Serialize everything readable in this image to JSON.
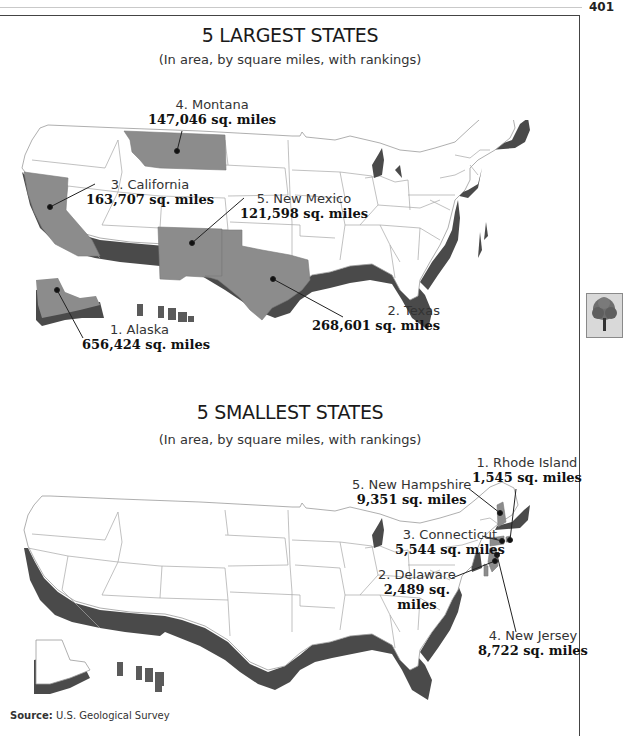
{
  "page": {
    "number": "401"
  },
  "colors": {
    "highlight_state": "#8c8c8c",
    "coast_shadow": "#4a4a4a",
    "state_lines": "#9a9a9a",
    "text": "#1a1a1a"
  },
  "largest": {
    "title": "5 LARGEST STATES",
    "subtitle": "(In area, by square miles, with rankings)",
    "states": [
      {
        "rank": "1",
        "name": "1. Alaska",
        "area": "656,424 sq. miles"
      },
      {
        "rank": "2",
        "name": "2. Texas",
        "area": "268,601 sq. miles"
      },
      {
        "rank": "3",
        "name": "3. California",
        "area": "163,707 sq. miles"
      },
      {
        "rank": "4",
        "name": "4. Montana",
        "area": "147,046 sq. miles"
      },
      {
        "rank": "5",
        "name": "5. New Mexico",
        "area": "121,598 sq. miles"
      }
    ]
  },
  "smallest": {
    "title": "5 SMALLEST STATES",
    "subtitle": "(In area, by square miles, with rankings)",
    "states": [
      {
        "rank": "1",
        "name": "1. Rhode Island",
        "area": "1,545 sq. miles"
      },
      {
        "rank": "2",
        "name": "2. Delaware",
        "area_line1": "2,489 sq.",
        "area_line2": "miles"
      },
      {
        "rank": "3",
        "name": "3. Connecticut",
        "area": "5,544 sq. miles"
      },
      {
        "rank": "4",
        "name": "4. New Jersey",
        "area": "8,722 sq. miles"
      },
      {
        "rank": "5",
        "name": "5. New Hampshire",
        "area": "9,351 sq. miles"
      }
    ]
  },
  "source": {
    "label": "Source:",
    "text": "U.S. Geological Survey"
  },
  "side_icon": {
    "name": "tree"
  }
}
